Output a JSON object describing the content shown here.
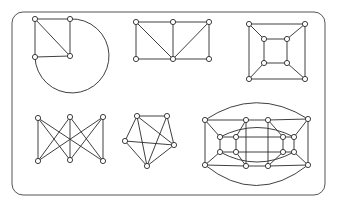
{
  "figure": {
    "frame": {
      "x": 12,
      "y": 12,
      "w": 313,
      "h": 183,
      "r": 11
    },
    "node_radius": 2.6,
    "colors": {
      "stroke": "#2a2a2a",
      "node_fill": "#ffffff",
      "frame_stroke": "#555555"
    },
    "graphs": [
      {
        "name": "graph-square-with-arc",
        "nodes": [
          [
            35,
            19
          ],
          [
            70,
            19
          ],
          [
            35,
            57
          ],
          [
            70,
            56
          ]
        ],
        "edges": [
          [
            0,
            1
          ],
          [
            0,
            2
          ],
          [
            1,
            3
          ],
          [
            2,
            3
          ],
          [
            0,
            3
          ]
        ],
        "paths": [
          "M70,19 A37,37 0 1 1 35,57"
        ]
      },
      {
        "name": "graph-two-by-three-grid",
        "nodes": [
          [
            136,
            22
          ],
          [
            173,
            22
          ],
          [
            209,
            22
          ],
          [
            136,
            59
          ],
          [
            173,
            59
          ],
          [
            209,
            59
          ]
        ],
        "edges": [
          [
            0,
            1
          ],
          [
            1,
            2
          ],
          [
            3,
            4
          ],
          [
            4,
            5
          ],
          [
            0,
            3
          ],
          [
            1,
            4
          ],
          [
            2,
            5
          ],
          [
            0,
            4
          ],
          [
            2,
            4
          ]
        ],
        "paths": []
      },
      {
        "name": "graph-cube",
        "nodes": [
          [
            249,
            24
          ],
          [
            305,
            24
          ],
          [
            249,
            79
          ],
          [
            305,
            79
          ],
          [
            264,
            39
          ],
          [
            287,
            39
          ],
          [
            264,
            63
          ],
          [
            287,
            63
          ]
        ],
        "edges": [
          [
            0,
            1
          ],
          [
            1,
            3
          ],
          [
            3,
            2
          ],
          [
            2,
            0
          ],
          [
            4,
            5
          ],
          [
            5,
            7
          ],
          [
            7,
            6
          ],
          [
            6,
            4
          ],
          [
            0,
            4
          ],
          [
            1,
            5
          ],
          [
            2,
            6
          ],
          [
            3,
            7
          ]
        ],
        "paths": []
      },
      {
        "name": "graph-k33",
        "nodes": [
          [
            38,
            118
          ],
          [
            70,
            117
          ],
          [
            103,
            117
          ],
          [
            38,
            161
          ],
          [
            70,
            160
          ],
          [
            103,
            161
          ]
        ],
        "edges": [
          [
            0,
            3
          ],
          [
            0,
            4
          ],
          [
            0,
            5
          ],
          [
            1,
            3
          ],
          [
            1,
            4
          ],
          [
            1,
            5
          ],
          [
            2,
            3
          ],
          [
            2,
            4
          ],
          [
            2,
            5
          ]
        ],
        "paths": []
      },
      {
        "name": "graph-pentagon-k5-minus-edge",
        "nodes": [
          [
            137,
            116
          ],
          [
            167,
            116
          ],
          [
            125,
            141
          ],
          [
            174,
            145
          ],
          [
            147,
            166
          ]
        ],
        "edges": [
          [
            0,
            1
          ],
          [
            0,
            2
          ],
          [
            0,
            4
          ],
          [
            0,
            3
          ],
          [
            1,
            3
          ],
          [
            1,
            4
          ],
          [
            2,
            3
          ],
          [
            2,
            4
          ],
          [
            3,
            4
          ]
        ],
        "paths": []
      },
      {
        "name": "graph-nested-prism",
        "nodes": [
          [
            205,
            120
          ],
          [
            246,
            120
          ],
          [
            268,
            120
          ],
          [
            308,
            119
          ],
          [
            205,
            165
          ],
          [
            246,
            166
          ],
          [
            268,
            166
          ],
          [
            308,
            165
          ],
          [
            220,
            137
          ],
          [
            236,
            137
          ],
          [
            220,
            152
          ],
          [
            236,
            152
          ],
          [
            283,
            137
          ],
          [
            294,
            137
          ],
          [
            283,
            152
          ],
          [
            294,
            152
          ]
        ],
        "edges": [
          [
            0,
            1
          ],
          [
            1,
            2
          ],
          [
            2,
            3
          ],
          [
            4,
            5
          ],
          [
            5,
            6
          ],
          [
            6,
            7
          ],
          [
            0,
            4
          ],
          [
            3,
            7
          ],
          [
            0,
            8
          ],
          [
            4,
            10
          ],
          [
            1,
            9
          ],
          [
            5,
            11
          ],
          [
            8,
            9
          ],
          [
            10,
            11
          ],
          [
            8,
            10
          ],
          [
            9,
            11
          ],
          [
            2,
            12
          ],
          [
            3,
            13
          ],
          [
            6,
            14
          ],
          [
            7,
            15
          ],
          [
            12,
            13
          ],
          [
            14,
            15
          ],
          [
            12,
            14
          ],
          [
            13,
            15
          ],
          [
            9,
            12
          ],
          [
            11,
            14
          ],
          [
            1,
            5
          ],
          [
            2,
            6
          ]
        ],
        "paths": [
          "M205,120 Q256,86 308,119",
          "M205,165 Q256,206 308,165",
          "M220,137 Q257,118 294,137",
          "M220,152 Q257,172 294,152"
        ]
      }
    ]
  }
}
